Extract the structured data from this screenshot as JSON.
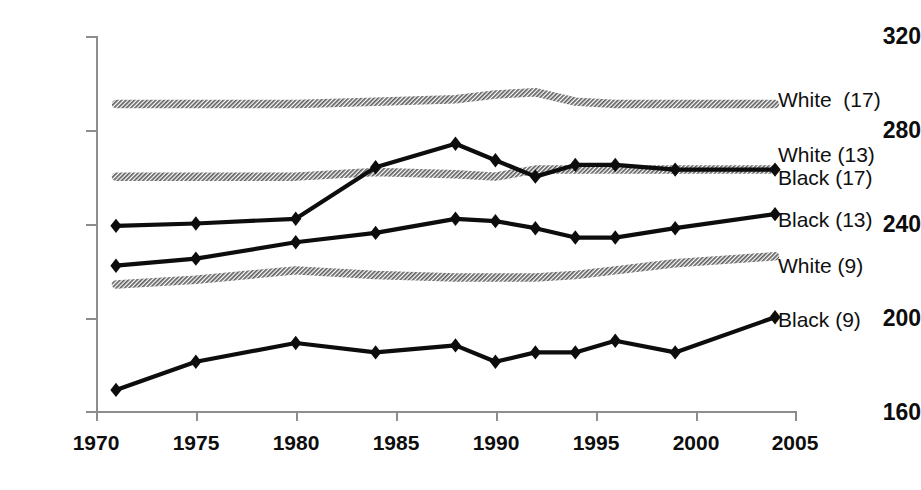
{
  "chart_data": {
    "type": "line",
    "title": "",
    "subtitle": "",
    "xlabel": "",
    "ylabel": "",
    "xlim": [
      1970,
      2005
    ],
    "ylim": [
      160,
      320
    ],
    "xticks": [
      1970,
      1975,
      1980,
      1985,
      1990,
      1995,
      2000,
      2005
    ],
    "yticks": [
      160,
      200,
      240,
      280,
      320
    ],
    "grid": false,
    "legend_position": "right-outside-line-ends",
    "series": [
      {
        "name": "White  (17)",
        "style": "gray-hatched",
        "color": "#5f5f5f",
        "marker": "none",
        "x": [
          1971,
          1975,
          1980,
          1984,
          1988,
          1990,
          1992,
          1994,
          1996,
          1999,
          2004
        ],
        "values": [
          291,
          291,
          291,
          292,
          293,
          295,
          296,
          292,
          291,
          291,
          291
        ]
      },
      {
        "name": "White (13)\nBlack (17)",
        "style": "gray-hatched",
        "color": "#5f5f5f",
        "marker": "none",
        "x": [
          1971,
          1975,
          1980,
          1984,
          1988,
          1990,
          1992,
          1994,
          1996,
          1999,
          2004
        ],
        "values": [
          260,
          260,
          260,
          262,
          261,
          260,
          263,
          263,
          263,
          263,
          263
        ]
      },
      {
        "name": "Black (17)",
        "style": "black-solid",
        "color": "#0d0d0d",
        "marker": "diamond",
        "x": [
          1971,
          1975,
          1980,
          1984,
          1988,
          1990,
          1992,
          1994,
          1996,
          1999,
          2004
        ],
        "values": [
          239,
          240,
          242,
          264,
          274,
          267,
          260,
          265,
          265,
          263,
          263
        ]
      },
      {
        "name": "Black (13)",
        "style": "black-solid",
        "color": "#0d0d0d",
        "marker": "diamond",
        "x": [
          1971,
          1975,
          1980,
          1984,
          1988,
          1990,
          1992,
          1994,
          1996,
          1999,
          2004
        ],
        "values": [
          222,
          225,
          232,
          236,
          242,
          241,
          238,
          234,
          234,
          238,
          244
        ]
      },
      {
        "name": "White (9)",
        "style": "gray-hatched",
        "color": "#5f5f5f",
        "marker": "none",
        "x": [
          1971,
          1975,
          1980,
          1984,
          1988,
          1990,
          1992,
          1994,
          1996,
          1999,
          2004
        ],
        "values": [
          214,
          216,
          220,
          218,
          217,
          217,
          217,
          218,
          220,
          223,
          226
        ]
      },
      {
        "name": "Black (9)",
        "style": "black-solid",
        "color": "#0d0d0d",
        "marker": "diamond",
        "x": [
          1971,
          1975,
          1980,
          1984,
          1988,
          1990,
          1992,
          1994,
          1996,
          1999,
          2004
        ],
        "values": [
          169,
          181,
          189,
          185,
          188,
          181,
          185,
          185,
          190,
          185,
          200
        ]
      }
    ]
  },
  "axis": {
    "y_tick_labels": [
      "320",
      "280",
      "240",
      "200",
      "160"
    ],
    "x_tick_labels": [
      "1970",
      "1975",
      "1980",
      "1985",
      "1990",
      "1995",
      "2000",
      "2005"
    ]
  },
  "labels": {
    "white_17": "White  (17)",
    "white_13": "White (13)",
    "black_17": "Black (17)",
    "black_13": "Black (13)",
    "white_9": "White (9)",
    "black_9": "Black (9)"
  },
  "colors": {
    "black_series": "#0d0d0d",
    "gray_series": "#5f5f5f",
    "axis": "#8d8d8d",
    "text": "#0d0d0d",
    "background": "#ffffff"
  }
}
